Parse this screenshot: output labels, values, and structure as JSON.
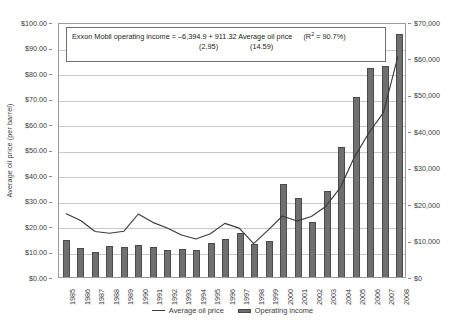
{
  "chart_data": {
    "type": "bar",
    "title": "",
    "categories": [
      "1985",
      "1986",
      "1987",
      "1988",
      "1989",
      "1990",
      "1991",
      "1992",
      "1993",
      "1994",
      "1995",
      "1996",
      "1997",
      "1998",
      "1999",
      "2000",
      "2001",
      "2002",
      "2003",
      "2004",
      "2005",
      "2006",
      "2007",
      "2008"
    ],
    "series": [
      {
        "name": "Average oil price",
        "type": "line",
        "axis": "left",
        "unit": "USD per barrel",
        "values": [
          25.0,
          22.3,
          18.0,
          17.3,
          18.1,
          24.9,
          21.6,
          19.4,
          16.6,
          15.0,
          17.1,
          21.2,
          19.3,
          13.2,
          18.5,
          24.1,
          22.1,
          23.9,
          27.9,
          35.2,
          47.5,
          57.0,
          65.0,
          87.0
        ]
      },
      {
        "name": "Operating income",
        "type": "bar",
        "axis": "right",
        "unit": "USD millions",
        "values": [
          10100,
          7900,
          7000,
          8400,
          8200,
          8700,
          8300,
          7300,
          7600,
          7300,
          9400,
          10400,
          12000,
          9000,
          10000,
          25500,
          21800,
          15200,
          23600,
          35700,
          49400,
          57400,
          58000,
          66800
        ]
      }
    ],
    "xlabel": "",
    "ylabel": "Average oil price (per barrel)",
    "y2label": "Exxon operating income for the year (in millions)",
    "ylim": [
      0,
      100
    ],
    "y2lim": [
      0,
      70000
    ],
    "yticks": [
      "$0.00",
      "$10.00",
      "$20.00",
      "$30.00",
      "$40.00",
      "$50.00",
      "$60.00",
      "$70.00",
      "$80.00",
      "$90.00",
      "$100.00"
    ],
    "y2ticks": [
      "$0",
      "$10,000",
      "$20,000",
      "$30,000",
      "$40,000",
      "$50,000",
      "$60,000",
      "$70,000"
    ],
    "grid": true,
    "legend_position": "bottom",
    "annotations": {
      "regression_equation": "Exxon Mobil operating income = –6,394.9  +   911.32 Average oil price",
      "r_squared_label": "(R2 = 90.7%)",
      "r_squared_prefix": "(R",
      "r_squared_suffix": " = 90.7%)",
      "r_squared_exponent": "2",
      "std_error_intercept": "(2.95)",
      "std_error_slope": "(14.59)"
    }
  },
  "legend": {
    "items": [
      {
        "label": "Average oil price",
        "marker": "line",
        "color": "#3c3c3c"
      },
      {
        "label": "Operating income",
        "marker": "bar",
        "color": "#6f6f70"
      }
    ]
  },
  "colors": {
    "bar_fill": "#6f6f70",
    "bar_edge": "#4a4a4b",
    "line": "#3c3c3c",
    "gridline": "#c8c8c8",
    "plot_border": "#9a9a9a",
    "text": "#3a3a3a",
    "background": "#ffffff"
  }
}
